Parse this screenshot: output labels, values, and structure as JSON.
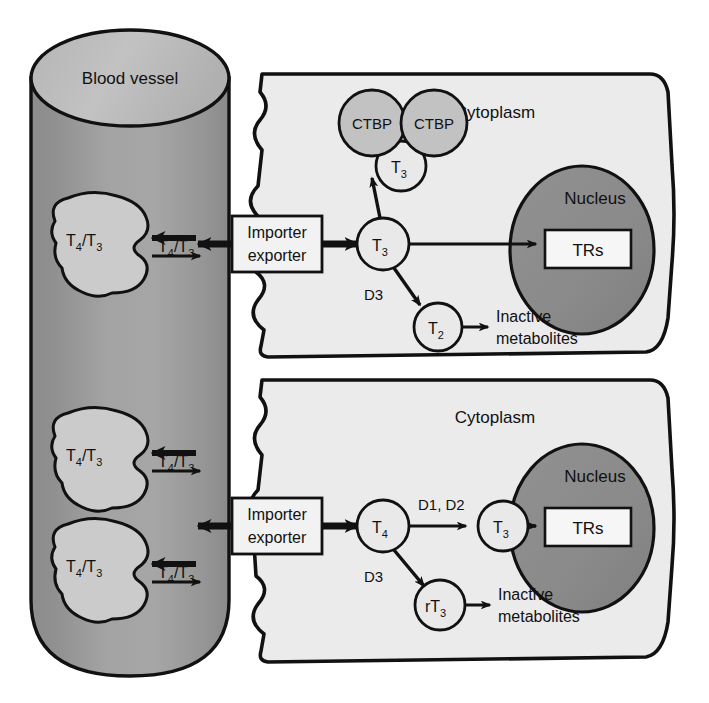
{
  "figure": {
    "type": "biological-pathway-diagram",
    "title_visible": false
  },
  "colors": {
    "vessel_body": "#9a9a9a",
    "vessel_top": "#b8b8b8",
    "blob_fill": "#c9c9c9",
    "cytoplasm": "#ebebeb",
    "nucleus": "#8e8e8e",
    "circle_light": "#e9e9e9",
    "circle_gray": "#c2c2c2",
    "box_fill": "#f2f2f2",
    "outline": "#111111",
    "page_background": "#ffffff"
  },
  "vessel": {
    "label": "Blood vessel",
    "blobs": [
      {
        "label_line1": "T",
        "label_sub1": "4",
        "label_mid": "/T",
        "label_sub2": "3",
        "text": "T4/T3"
      },
      {
        "label_line1": "T",
        "label_sub1": "4",
        "label_mid": "/T",
        "label_sub2": "3",
        "text": "T4/T3"
      },
      {
        "label_line1": "T",
        "label_sub1": "4",
        "label_mid": "/T",
        "label_sub2": "3",
        "text": "T4/T3"
      }
    ],
    "free_hormone_labels": [
      "T4/T3",
      "T4/T3",
      "T4/T3"
    ]
  },
  "cells": [
    {
      "id": "upper-cell",
      "cytoplasm_label": "Cytoplasm",
      "nucleus_label": "Nucleus",
      "receptor_label": "TRs",
      "transporter_label_line1": "Importer",
      "transporter_label_line2": "exporter",
      "inactive_label_line1": "Inactive",
      "inactive_label_line2": "metabolites",
      "binding_proteins": [
        "CTBP",
        "CTBP"
      ],
      "bound_hormone": {
        "base": "T",
        "sub": "3"
      },
      "cytoplasmic_hormone": {
        "base": "T",
        "sub": "3"
      },
      "metabolite": {
        "base": "T",
        "sub": "2"
      },
      "enzymes": {
        "deiodination": "D3"
      }
    },
    {
      "id": "lower-cell",
      "cytoplasm_label": "Cytoplasm",
      "nucleus_label": "Nucleus",
      "receptor_label": "TRs",
      "transporter_label_line1": "Importer",
      "transporter_label_line2": "exporter",
      "inactive_label_line1": "Inactive",
      "inactive_label_line2": "metabolites",
      "prohormone": {
        "base": "T",
        "sub": "4"
      },
      "active_hormone": {
        "base": "T",
        "sub": "3"
      },
      "metabolite": {
        "pre": "r",
        "base": "T",
        "sub": "3"
      },
      "enzymes": {
        "activation": "D1, D2",
        "deiodination": "D3"
      }
    }
  ]
}
